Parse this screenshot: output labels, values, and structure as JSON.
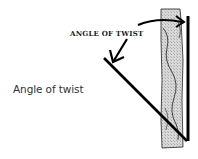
{
  "figure": {
    "label": "ANGLE OF TWIST",
    "caption": "Angle of twist",
    "colors": {
      "ink": "#000000",
      "pillar_fill": "#d4d4d4",
      "caption_text": "#333333"
    },
    "elements": [
      "twisted-pillar",
      "reference-line",
      "twisted-line",
      "angle-arrow-top",
      "angle-arrow-left"
    ]
  }
}
